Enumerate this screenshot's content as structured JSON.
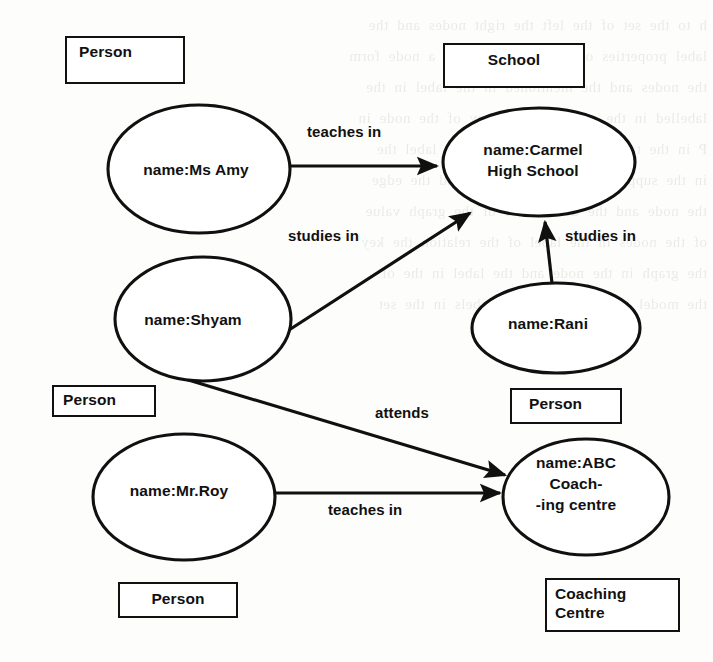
{
  "diagram": {
    "background_color": "#fdfdfb",
    "ink_color": "#111111",
    "bleed_text": "h  to  the  set  of  the  left  the  right  nodes  and  the\nlabel  properties  of  a  value  is  held  in  a  node  form\nthe  nodes  and  the  mentioned  in  the  label  in  the\nlabelled  in  the  graph  and  the  key  of  the  node  in\nP  in  the  tables  and  the  stored  in  the  label  the\nin  the  supports  the  set  of  a  node  and  the  edge\nthe  node  and  the  data  is  the  of  the  graph  value\nof  the  nodes  in  the  label  of  the  relation  the  key\nthe  graph  in  the  node  and  the  label  in  the  of\nthe  model  is  the  node  of  the  labels  in  the  set"
  },
  "class_boxes": [
    {
      "id": "box-person-amy",
      "lines": [
        "Person"
      ],
      "align": "left"
    },
    {
      "id": "box-school",
      "lines": [
        "School"
      ],
      "align": "center"
    },
    {
      "id": "box-person-shyam",
      "lines": [
        "Person"
      ],
      "align": "left"
    },
    {
      "id": "box-person-rani",
      "lines": [
        "Person"
      ],
      "align": "left"
    },
    {
      "id": "box-person-roy",
      "lines": [
        "Person"
      ],
      "align": "center"
    },
    {
      "id": "box-coaching",
      "lines": [
        "Coaching",
        "Centre"
      ],
      "align": "left"
    }
  ],
  "nodes": [
    {
      "id": "node-amy",
      "lines": [
        "name:Ms Amy"
      ]
    },
    {
      "id": "node-carmel",
      "lines": [
        "name:Carmel",
        "High School"
      ]
    },
    {
      "id": "node-shyam",
      "lines": [
        "name:Shyam"
      ]
    },
    {
      "id": "node-rani",
      "lines": [
        "name:Rani"
      ]
    },
    {
      "id": "node-roy",
      "lines": [
        "name:Mr.Roy"
      ]
    },
    {
      "id": "node-abc",
      "lines": [
        "name:ABC",
        "Coach-",
        "-ing centre"
      ]
    }
  ],
  "edges": [
    {
      "id": "edge-amy-carmel",
      "label": "teaches in",
      "from": "name:Ms Amy",
      "to": "name:Carmel High School"
    },
    {
      "id": "edge-shyam-carmel",
      "label": "studies in",
      "from": "name:Shyam",
      "to": "name:Carmel High School"
    },
    {
      "id": "edge-rani-carmel",
      "label": "studies in",
      "from": "name:Rani",
      "to": "name:Carmel High School"
    },
    {
      "id": "edge-shyam-abc",
      "label": "attends",
      "from": "name:Shyam",
      "to": "name:ABC Coaching centre"
    },
    {
      "id": "edge-roy-abc",
      "label": "teaches in",
      "from": "name:Mr.Roy",
      "to": "name:ABC Coaching centre"
    }
  ]
}
